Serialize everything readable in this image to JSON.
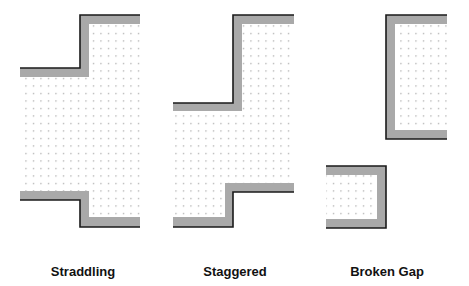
{
  "figures": [
    {
      "id": "straddling",
      "label": "Straddling",
      "label_x": 83
    },
    {
      "id": "staggered",
      "label": "Staggered",
      "label_x": 235
    },
    {
      "id": "broken-gap",
      "label": "Broken Gap",
      "label_x": 387
    }
  ],
  "colors": {
    "outline": "#1a1a1a",
    "band": "#a9a9a9",
    "dot": "#9a9a9a",
    "background": "#ffffff"
  }
}
